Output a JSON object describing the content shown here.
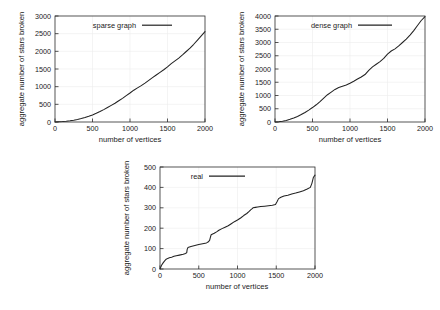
{
  "figure": {
    "background": "#ffffff",
    "line_color": "#222222",
    "grid_color": "#ececec",
    "axis_color": "#2b2b2b"
  },
  "chart_data": [
    {
      "id": "sparse",
      "type": "line",
      "title": "",
      "xlabel": "number of vertices",
      "ylabel": "aggregate number of stars broken",
      "legend": [
        "sparse graph"
      ],
      "legend_position": "top-left inside",
      "grid": true,
      "xlim": [
        0,
        2000
      ],
      "ylim": [
        0,
        3000
      ],
      "xticks": [
        0,
        500,
        1000,
        1500,
        2000
      ],
      "yticks": [
        0,
        500,
        1000,
        1500,
        2000,
        2500,
        3000
      ],
      "series": [
        {
          "name": "sparse graph",
          "x": [
            0,
            50,
            100,
            150,
            200,
            250,
            300,
            350,
            400,
            450,
            500,
            550,
            600,
            650,
            700,
            750,
            800,
            850,
            900,
            950,
            1000,
            1050,
            1100,
            1150,
            1200,
            1250,
            1300,
            1350,
            1400,
            1450,
            1500,
            1550,
            1600,
            1650,
            1700,
            1750,
            1800,
            1850,
            1900,
            1950,
            2000
          ],
          "values": [
            0,
            5,
            12,
            22,
            35,
            52,
            72,
            96,
            125,
            160,
            200,
            245,
            295,
            350,
            410,
            470,
            530,
            600,
            670,
            745,
            820,
            900,
            965,
            1030,
            1100,
            1180,
            1255,
            1330,
            1405,
            1480,
            1560,
            1650,
            1730,
            1810,
            1900,
            1995,
            2090,
            2200,
            2320,
            2440,
            2560
          ]
        }
      ]
    },
    {
      "id": "dense",
      "type": "line",
      "title": "",
      "xlabel": "number of vertices",
      "ylabel": "aggregate number of stars broken",
      "legend": [
        "dense graph"
      ],
      "legend_position": "top-left inside",
      "grid": true,
      "xlim": [
        0,
        2000
      ],
      "ylim": [
        0,
        4000
      ],
      "xticks": [
        0,
        500,
        1000,
        1500,
        2000
      ],
      "yticks": [
        0,
        500,
        1000,
        1500,
        2000,
        2500,
        3000,
        3500,
        4000
      ],
      "series": [
        {
          "name": "dense graph",
          "x": [
            0,
            50,
            100,
            150,
            200,
            250,
            300,
            350,
            400,
            450,
            500,
            550,
            600,
            650,
            700,
            750,
            800,
            850,
            900,
            950,
            1000,
            1050,
            1100,
            1150,
            1200,
            1250,
            1300,
            1350,
            1400,
            1450,
            1500,
            1550,
            1600,
            1650,
            1700,
            1750,
            1800,
            1850,
            1900,
            1950,
            2000
          ],
          "values": [
            0,
            10,
            30,
            60,
            100,
            150,
            210,
            280,
            360,
            450,
            545,
            650,
            770,
            900,
            1030,
            1130,
            1230,
            1300,
            1350,
            1400,
            1465,
            1540,
            1620,
            1700,
            1790,
            1950,
            2080,
            2180,
            2280,
            2400,
            2560,
            2680,
            2760,
            2870,
            3000,
            3130,
            3280,
            3450,
            3640,
            3830,
            3980
          ]
        }
      ]
    },
    {
      "id": "real",
      "type": "line",
      "title": "",
      "xlabel": "number of vertices",
      "ylabel": "aggregate number of stars broken",
      "legend": [
        "real"
      ],
      "legend_position": "top-left inside",
      "grid": true,
      "xlim": [
        0,
        2000
      ],
      "ylim": [
        0,
        500
      ],
      "xticks": [
        0,
        500,
        1000,
        1500,
        2000
      ],
      "yticks": [
        0,
        100,
        200,
        300,
        400,
        500
      ],
      "series": [
        {
          "name": "real",
          "x": [
            0,
            20,
            40,
            60,
            80,
            100,
            120,
            150,
            180,
            210,
            250,
            300,
            330,
            345,
            350,
            360,
            400,
            450,
            500,
            550,
            600,
            620,
            640,
            650,
            660,
            700,
            730,
            760,
            800,
            840,
            880,
            920,
            960,
            1000,
            1040,
            1080,
            1120,
            1150,
            1170,
            1190,
            1200,
            1230,
            1260,
            1300,
            1350,
            1400,
            1450,
            1490,
            1510,
            1530,
            1560,
            1600,
            1650,
            1700,
            1750,
            1800,
            1850,
            1900,
            1940,
            1960,
            1980,
            2000
          ],
          "values": [
            0,
            18,
            30,
            40,
            48,
            52,
            55,
            58,
            62,
            65,
            68,
            72,
            76,
            80,
            95,
            105,
            110,
            115,
            120,
            124,
            128,
            132,
            140,
            155,
            168,
            175,
            182,
            190,
            198,
            205,
            212,
            222,
            232,
            240,
            250,
            262,
            272,
            282,
            290,
            296,
            300,
            302,
            304,
            306,
            308,
            310,
            312,
            316,
            330,
            345,
            352,
            358,
            362,
            368,
            372,
            378,
            384,
            392,
            400,
            420,
            450,
            460
          ]
        }
      ]
    }
  ]
}
